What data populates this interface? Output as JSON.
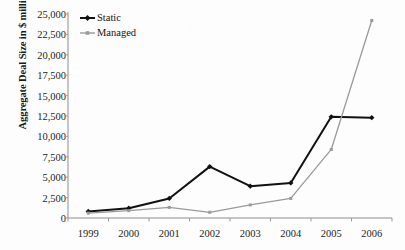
{
  "chart_data": {
    "type": "line",
    "title": "",
    "xlabel": "",
    "ylabel": "Aggregate Deal Size in $ millions",
    "categories": [
      "1999",
      "2000",
      "2001",
      "2002",
      "2003",
      "2004",
      "2005",
      "2006"
    ],
    "ylim": [
      0,
      25000
    ],
    "ytick_step": 2500,
    "ytick_labels": [
      "25,000",
      "22,500",
      "20,000",
      "17,500",
      "15,000",
      "12,500",
      "10,000",
      "7,500",
      "5,000",
      "2,500",
      "0"
    ],
    "ytick_values": [
      25000,
      22500,
      20000,
      17500,
      15000,
      12500,
      10000,
      7500,
      5000,
      2500,
      0
    ],
    "grid": false,
    "legend_position": "top-left",
    "series": [
      {
        "name": "Static",
        "color": "#111111",
        "marker": "diamond",
        "values": [
          800,
          1200,
          2400,
          6300,
          3900,
          4300,
          12400,
          12300
        ]
      },
      {
        "name": "Managed",
        "color": "#9a9a9a",
        "marker": "square",
        "values": [
          600,
          900,
          1300,
          700,
          1600,
          2400,
          8400,
          24200
        ]
      }
    ]
  },
  "axis": {
    "line_color": "#8d8d8d",
    "tick_color": "#9b9b9b"
  },
  "page": {
    "background": "#fdfdfd"
  }
}
